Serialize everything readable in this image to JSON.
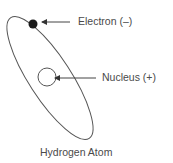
{
  "diagram": {
    "title": "Hydrogen Atom",
    "labels": {
      "electron": "Electron (–)",
      "nucleus": "Nucleus (+)"
    },
    "colors": {
      "line": "#555555",
      "electron_fill": "#1a1a1a",
      "text": "#4a4a4a"
    }
  }
}
